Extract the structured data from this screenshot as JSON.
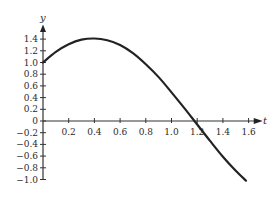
{
  "chart_data": {
    "type": "line",
    "title": "",
    "xlabel": "t",
    "ylabel": "y",
    "xlim": [
      0,
      1.6
    ],
    "ylim": [
      -1.0,
      1.4
    ],
    "grid": false,
    "legend": null,
    "x_ticks": [
      "0.2",
      "0.4",
      "0.6",
      "0.8",
      "1.0",
      "1.2",
      "1.4",
      "1.6"
    ],
    "y_ticks": [
      "1.4",
      "1.2",
      "1.0",
      "0.8",
      "0.6",
      "0.4",
      "0.2",
      "0",
      "−0.2",
      "−0.4",
      "−0.6",
      "−0.8",
      "−1.0"
    ],
    "series": [
      {
        "name": "y(t)",
        "color": "#222222",
        "x": [
          0,
          0.1,
          0.2,
          0.3,
          0.4,
          0.5,
          0.6,
          0.7,
          0.8,
          0.9,
          1.0,
          1.1,
          1.2,
          1.3,
          1.4,
          1.5,
          1.58
        ],
        "y": [
          1.0,
          1.18,
          1.31,
          1.39,
          1.41,
          1.38,
          1.3,
          1.16,
          0.97,
          0.75,
          0.49,
          0.22,
          -0.06,
          -0.34,
          -0.61,
          -0.85,
          -1.02
        ]
      }
    ],
    "annotations": []
  }
}
